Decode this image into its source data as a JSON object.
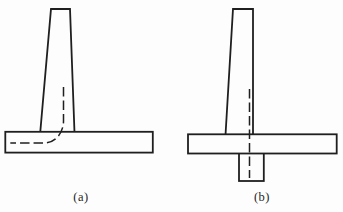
{
  "figure": {
    "background": "#fdfdfd",
    "line_color": "#1f1f1f",
    "diagrams": [
      {
        "label": "(a)",
        "parts": [
          "tapered-wall-stem",
          "base-slab",
          "dashed-reinforcement-line-bending-into-heel"
        ]
      },
      {
        "label": "(b)",
        "parts": [
          "tapered-wall-stem",
          "base-slab",
          "shear-key-below-base",
          "dashed-centerline-through-key"
        ]
      }
    ]
  }
}
